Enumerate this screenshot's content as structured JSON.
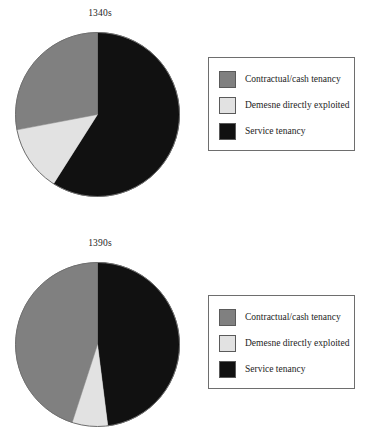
{
  "colors": {
    "contractual": "#808080",
    "demesne": "#e2e2e2",
    "service": "#111111",
    "outline": "#6e6e6e",
    "background": "#ffffff",
    "text": "#1c1c1c"
  },
  "legend": {
    "items": [
      {
        "label": "Contractual/cash tenancy",
        "swatch": "contractual"
      },
      {
        "label": "Demesne directly exploited",
        "swatch": "demesne"
      },
      {
        "label": "Service tenancy",
        "swatch": "service"
      }
    ]
  },
  "chart_data": [
    {
      "type": "pie",
      "title": "1340s",
      "categories": [
        "Service tenancy",
        "Demesne directly exploited",
        "Contractual/cash tenancy"
      ],
      "values": [
        59,
        13,
        28
      ],
      "value_unit": "percent",
      "start_angle_deg": 0,
      "direction": "clockwise",
      "legend_position": "right",
      "legend_entries": [
        "Contractual/cash tenancy",
        "Demesne directly exploited",
        "Service tenancy"
      ],
      "slice_colors": [
        "service",
        "demesne",
        "contractual"
      ],
      "xlabel": "",
      "ylabel": ""
    },
    {
      "type": "pie",
      "title": "1390s",
      "categories": [
        "Service tenancy",
        "Demesne directly exploited",
        "Contractual/cash tenancy"
      ],
      "values": [
        48,
        7,
        45
      ],
      "value_unit": "percent",
      "start_angle_deg": 0,
      "direction": "clockwise",
      "legend_position": "right",
      "legend_entries": [
        "Contractual/cash tenancy",
        "Demesne directly exploited",
        "Service tenancy"
      ],
      "slice_colors": [
        "service",
        "demesne",
        "contractual"
      ],
      "xlabel": "",
      "ylabel": ""
    }
  ]
}
